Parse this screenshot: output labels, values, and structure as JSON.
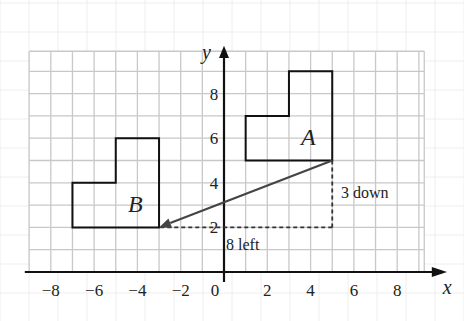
{
  "figure": {
    "type": "coordinate-grid-translation",
    "axes": {
      "x_label": "x",
      "y_label": "y",
      "x_ticks": [
        -8,
        -6,
        -4,
        -2,
        0,
        2,
        4,
        6,
        8
      ],
      "x_tick_labels": [
        "−8",
        "−6",
        "−4",
        "−2",
        "0",
        "2",
        "4",
        "6",
        "8"
      ],
      "y_ticks": [
        2,
        4,
        6,
        8
      ],
      "y_tick_labels": [
        "2",
        "4",
        "6",
        "8"
      ],
      "x_range": [
        -9,
        9.3
      ],
      "y_range": [
        0,
        10
      ]
    },
    "shapes": [
      {
        "name": "A",
        "label": "A",
        "vertices": [
          [
            1,
            5
          ],
          [
            5,
            5
          ],
          [
            5,
            9
          ],
          [
            3,
            9
          ],
          [
            3,
            7
          ],
          [
            1,
            7
          ]
        ],
        "label_pos": [
          3.9,
          5.7
        ]
      },
      {
        "name": "B",
        "label": "B",
        "vertices": [
          [
            -7,
            2
          ],
          [
            -3,
            2
          ],
          [
            -3,
            6
          ],
          [
            -5,
            6
          ],
          [
            -5,
            4
          ],
          [
            -7,
            4
          ]
        ],
        "label_pos": [
          -4.1,
          2.7
        ]
      }
    ],
    "translation_arrow": {
      "from": [
        5,
        5
      ],
      "to": [
        -3,
        2
      ]
    },
    "guides": {
      "vertical": {
        "from": [
          5,
          5
        ],
        "to": [
          5,
          2
        ],
        "label": "3 down"
      },
      "horizontal": {
        "from": [
          5,
          2
        ],
        "to": [
          -3,
          2
        ],
        "label": "8 left"
      }
    },
    "colors": {
      "grid": "#c8c8c8",
      "bg_grid": "#eeeeee",
      "shape": "#111111",
      "arrow": "#444444",
      "text": "#222222"
    }
  }
}
